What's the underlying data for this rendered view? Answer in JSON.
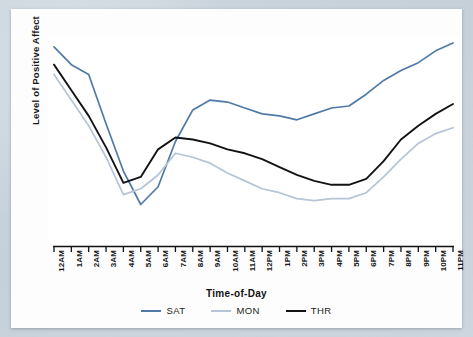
{
  "chart_data": {
    "type": "line",
    "title": "",
    "xlabel": "Time-of-Day",
    "ylabel": "Level of Positive Affect",
    "grid": false,
    "legend_position": "bottom",
    "axis": {
      "y_ticks_shown": false,
      "x_tick_marks": true,
      "ylim": [
        0,
        100
      ]
    },
    "categories": [
      "12AM",
      "1AM",
      "2AM",
      "3AM",
      "4AM",
      "5AM",
      "6AM",
      "7AM",
      "8AM",
      "9AM",
      "10AM",
      "11AM",
      "12PM",
      "1PM",
      "2PM",
      "3PM",
      "4PM",
      "5PM",
      "6PM",
      "7PM",
      "8PM",
      "9PM",
      "10PM",
      "11PM"
    ],
    "series": [
      {
        "name": "SAT",
        "color": "#4f7aa8",
        "values": [
          97,
          88,
          83,
          58,
          34,
          17,
          26,
          49,
          65,
          70,
          69,
          66,
          63,
          62,
          60,
          63,
          66,
          67,
          73,
          80,
          85,
          89,
          95,
          99
        ]
      },
      {
        "name": "MON",
        "color": "#b5c4d6",
        "values": [
          83,
          70,
          57,
          41,
          22,
          25,
          32,
          43,
          41,
          38,
          33,
          29,
          25,
          23,
          20,
          19,
          20,
          20,
          23,
          31,
          40,
          48,
          53,
          56
        ]
      },
      {
        "name": "THR",
        "color": "#111315",
        "values": [
          88,
          75,
          62,
          46,
          28,
          31,
          45,
          51,
          50,
          48,
          45,
          43,
          40,
          36,
          32,
          29,
          27,
          27,
          30,
          39,
          50,
          57,
          63,
          68
        ]
      }
    ]
  },
  "legend": {
    "items": [
      {
        "label": "SAT",
        "color": "#4f7aa8"
      },
      {
        "label": "MON",
        "color": "#b5c4d6"
      },
      {
        "label": "THR",
        "color": "#111315"
      }
    ]
  },
  "colors": {
    "background": "#c9d3dc",
    "card": "#fdfdfd",
    "plot": "#ffffff",
    "axis": "#111315",
    "text": "#15171a"
  }
}
